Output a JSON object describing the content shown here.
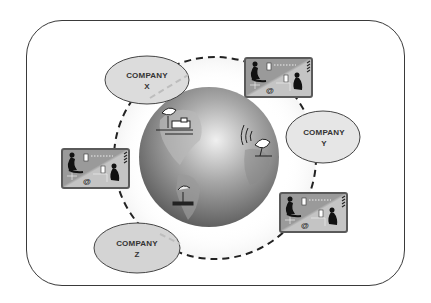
{
  "diagram": {
    "type": "network-ring",
    "center": {
      "kind": "globe",
      "icons": [
        "satellite-dish-ground-station",
        "satellite-dish-signal",
        "ground-terminal"
      ]
    },
    "ring_style": "dashed",
    "companies": [
      {
        "id": "x",
        "line1": "COMPANY",
        "line2": "X"
      },
      {
        "id": "y",
        "line1": "COMPANY",
        "line2": "Y"
      },
      {
        "id": "z",
        "line1": "COMPANY",
        "line2": "Z"
      }
    ],
    "workstations": [
      {
        "id": "top-right",
        "symbol": "@"
      },
      {
        "id": "left",
        "symbol": "@"
      },
      {
        "id": "bottom-right",
        "symbol": "@"
      }
    ]
  },
  "colors": {
    "frame": "#3a3a3a",
    "ellipse_fill": "#dcdcdc",
    "ellipse_stroke": "#444444",
    "dash": "#222222",
    "card_dark": "#9a9a9a",
    "card_light": "#c4c4c4",
    "globe_light": "#d8d8d8",
    "globe_dark": "#6a6a6a"
  }
}
